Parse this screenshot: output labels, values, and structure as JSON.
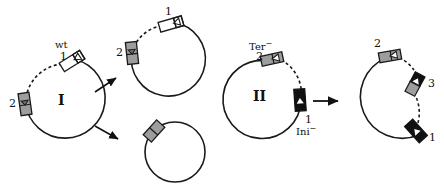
{
  "figure": {
    "type": "biology-diagram",
    "background": "#ffffff",
    "stroke_color": "#1a1a1a",
    "gray_fill": "#9d9d9d",
    "black_fill": "#111111",
    "white_fill": "#ffffff"
  },
  "panels": [
    {
      "id": "panel-1",
      "roman_label": "I",
      "parent": {
        "name": "circle-I",
        "markers": [
          {
            "id": "I-m1",
            "label": "1",
            "gene_label": "wt",
            "style": "white",
            "arrow": "left"
          },
          {
            "id": "I-m2",
            "label": "2",
            "gene_label": "",
            "style": "gray",
            "arrow": "down"
          }
        ],
        "dashed_arc": true
      },
      "products": [
        {
          "name": "circle-I-product-top",
          "markers": [
            {
              "id": "P1-m1",
              "label": "1",
              "style": "white",
              "arrow": "left"
            },
            {
              "id": "P1-m2",
              "label": "2",
              "style": "gray",
              "arrow": "down"
            }
          ],
          "dashed_arc": true
        },
        {
          "name": "circle-I-product-bottom",
          "markers": [
            {
              "id": "P2-m1",
              "label": "",
              "style": "gray",
              "arrow": "none"
            }
          ],
          "dashed_arc": false
        }
      ],
      "arrows": 2
    },
    {
      "id": "panel-2",
      "roman_label": "II",
      "parent": {
        "name": "circle-II",
        "markers": [
          {
            "id": "II-m2",
            "label": "2",
            "gene_label": "Ter",
            "gene_superscript": "−",
            "style": "gray",
            "arrow": "left"
          },
          {
            "id": "II-m1",
            "label": "1",
            "gene_label": "Ini",
            "gene_superscript": "−",
            "style": "black",
            "arrow": "up"
          }
        ],
        "dashed_arc": true
      },
      "products": [
        {
          "name": "circle-II-product",
          "markers": [
            {
              "id": "P3-m2",
              "label": "2",
              "style": "gray",
              "arrow": "left"
            },
            {
              "id": "P3-m3",
              "label": "3",
              "style": "hybrid",
              "arrow": "none"
            },
            {
              "id": "P3-m1",
              "label": "1",
              "style": "black",
              "arrow": "left"
            }
          ],
          "dashed_arc": true
        }
      ],
      "arrows": 1
    }
  ],
  "labels": {
    "wt": "wt",
    "ter": "Ter",
    "ini": "Ini",
    "minus": "−",
    "roman_one": "I",
    "roman_two": "II",
    "one": "1",
    "two": "2",
    "three": "3"
  }
}
